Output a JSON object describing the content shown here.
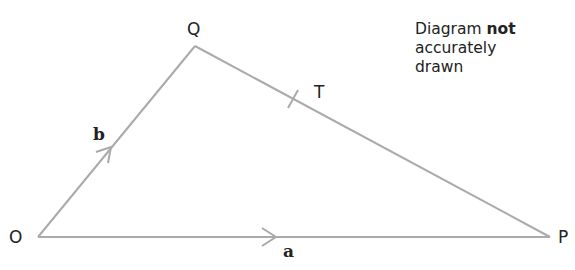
{
  "diagram": {
    "type": "vector triangle",
    "points": {
      "O": {
        "label": "O",
        "x": 38,
        "y": 237
      },
      "Q": {
        "label": "Q",
        "x": 195,
        "y": 46
      },
      "P": {
        "label": "P",
        "x": 550,
        "y": 237
      },
      "T": {
        "label": "T",
        "on_segment": "QP"
      }
    },
    "vectors": {
      "a": {
        "label": "a",
        "from": "O",
        "to": "P"
      },
      "b": {
        "label": "b",
        "from": "O",
        "to": "Q"
      }
    },
    "line_color": "#aaaaaa",
    "text_color": "#222222"
  },
  "note": {
    "line1_prefix": "Diagram ",
    "line1_bold": "not",
    "line2": "accurately",
    "line3": "drawn"
  }
}
